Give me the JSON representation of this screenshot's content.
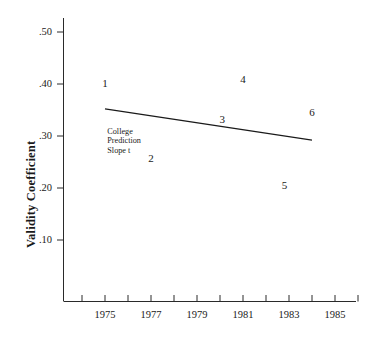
{
  "chart_data": {
    "type": "scatter",
    "title": "",
    "subtitle": "",
    "xlabel": "",
    "ylabel": "Validity Coefficient",
    "xlim": [
      1974,
      1986
    ],
    "ylim": [
      0.05,
      0.54
    ],
    "grid": false,
    "legend_position": "none",
    "x_ticks": [
      {
        "value": 1975,
        "label": "1975"
      },
      {
        "value": 1977,
        "label": "1977"
      },
      {
        "value": 1979,
        "label": "1979"
      },
      {
        "value": 1981,
        "label": "1981"
      },
      {
        "value": 1983,
        "label": "1983"
      },
      {
        "value": 1985,
        "label": "1985"
      }
    ],
    "x_minor_ticks": [
      1974,
      1976,
      1978,
      1980,
      1982,
      1984,
      1986
    ],
    "y_ticks": [
      {
        "value": 0.5,
        "label": ".50"
      },
      {
        "value": 0.4,
        "label": ".40"
      },
      {
        "value": 0.3,
        "label": ".30"
      },
      {
        "value": 0.2,
        "label": ".20"
      },
      {
        "value": 0.1,
        "label": ".10"
      }
    ],
    "points": [
      {
        "label": "1",
        "x": 1975.0,
        "y": 0.4
      },
      {
        "label": "2",
        "x": 1977.0,
        "y": 0.255
      },
      {
        "label": "3",
        "x": 1980.1,
        "y": 0.33
      },
      {
        "label": "4",
        "x": 1981.0,
        "y": 0.408
      },
      {
        "label": "5",
        "x": 1982.8,
        "y": 0.203
      },
      {
        "label": "6",
        "x": 1984.0,
        "y": 0.345
      }
    ],
    "trend_line": {
      "name": "College Prediction Slope",
      "x_start": 1975.0,
      "y_start": 0.352,
      "x_end": 1984.0,
      "y_end": 0.292
    },
    "annotation": {
      "lines": [
        "College",
        "Prediction",
        "Slope t"
      ],
      "x": 1975.1,
      "y": 0.318
    },
    "colors": {
      "axis": "#2a2a2a",
      "trend_line": "#1a1a1a",
      "text": "#1a1a1a",
      "background": "#ffffff"
    }
  }
}
